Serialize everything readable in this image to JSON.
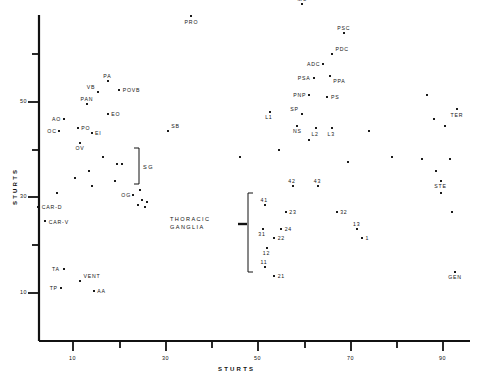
{
  "chart_data": {
    "type": "scatter",
    "title": "",
    "xlabel": "STURTS",
    "ylabel": "STURTS",
    "xlim": [
      0,
      100
    ],
    "ylim": [
      2,
      72
    ],
    "grid": false,
    "legend": "none",
    "xticks": [
      10,
      30,
      50,
      70,
      90
    ],
    "xtick_labels": [
      "10",
      "30",
      "50",
      "70",
      "90"
    ],
    "xminorticks": [
      20,
      40,
      60,
      80
    ],
    "yticks": [
      10,
      30,
      50
    ],
    "ytick_labels": [
      "10",
      "30",
      "50"
    ],
    "yminorticks": [
      20,
      40,
      60
    ],
    "annotations": [
      {
        "text": "SG",
        "x": 27.5,
        "y": 37.5,
        "kind": "bracket-group"
      },
      {
        "text": "THORACIC GANGLIA",
        "x": 38.0,
        "y": 25.0,
        "kind": "bracket-group"
      }
    ],
    "points": [
      {
        "label": "PRO",
        "x": 35.5,
        "y": 68.0,
        "lx": "center",
        "ly": "below"
      },
      {
        "label": "MU",
        "x": 59.5,
        "y": 70.5,
        "lx": "center",
        "ly": "above"
      },
      {
        "label": "PSC",
        "x": 68.5,
        "y": 64.5,
        "lx": "center",
        "ly": "above"
      },
      {
        "label": "PDC",
        "x": 66.0,
        "y": 60.0,
        "lx": "right",
        "ly": "above"
      },
      {
        "label": "ADC",
        "x": 64.0,
        "y": 58.0,
        "lx": "left",
        "ly": "mid"
      },
      {
        "label": "PPA",
        "x": 65.5,
        "y": 55.5,
        "lx": "right",
        "ly": "below"
      },
      {
        "label": "PSA",
        "x": 62.0,
        "y": 55.0,
        "lx": "left",
        "ly": "mid"
      },
      {
        "label": "PNP",
        "x": 61.0,
        "y": 51.5,
        "lx": "left",
        "ly": "mid"
      },
      {
        "label": "PS",
        "x": 65.0,
        "y": 51.0,
        "lx": "right",
        "ly": "mid"
      },
      {
        "label": "PA",
        "x": 17.5,
        "y": 54.5,
        "lx": "center",
        "ly": "above"
      },
      {
        "label": "VB",
        "x": 15.5,
        "y": 52.0,
        "lx": "left",
        "ly": "above"
      },
      {
        "label": "POVB",
        "x": 20.0,
        "y": 52.5,
        "lx": "right",
        "ly": "mid"
      },
      {
        "label": "PAN",
        "x": 13.0,
        "y": 49.5,
        "lx": "center",
        "ly": "above"
      },
      {
        "label": "EO",
        "x": 17.5,
        "y": 47.5,
        "lx": "right",
        "ly": "mid"
      },
      {
        "label": "AO",
        "x": 8.0,
        "y": 46.5,
        "lx": "left",
        "ly": "mid"
      },
      {
        "label": "PO",
        "x": 11.0,
        "y": 44.5,
        "lx": "right",
        "ly": "mid"
      },
      {
        "label": "OC",
        "x": 7.0,
        "y": 44.0,
        "lx": "left",
        "ly": "mid"
      },
      {
        "label": "EI",
        "x": 14.0,
        "y": 43.5,
        "lx": "right",
        "ly": "mid"
      },
      {
        "label": "OV",
        "x": 11.5,
        "y": 41.5,
        "lx": "center",
        "ly": "below"
      },
      {
        "label": "SB",
        "x": 30.5,
        "y": 44.0,
        "lx": "right",
        "ly": "above"
      },
      {
        "label": "L1",
        "x": 52.5,
        "y": 48.0,
        "lx": "center",
        "ly": "below"
      },
      {
        "label": "SP",
        "x": 59.5,
        "y": 47.5,
        "lx": "left",
        "ly": "above"
      },
      {
        "label": "NS",
        "x": 58.5,
        "y": 45.0,
        "lx": "center",
        "ly": "below"
      },
      {
        "label": "L2",
        "x": 62.5,
        "y": 44.5,
        "lx": "center",
        "ly": "below"
      },
      {
        "label": "L3",
        "x": 66.0,
        "y": 44.5,
        "lx": "center",
        "ly": "below"
      },
      {
        "label": "TER",
        "x": 93.0,
        "y": 48.5,
        "lx": "center",
        "ly": "below"
      },
      {
        "label": "STE",
        "x": 89.5,
        "y": 33.5,
        "lx": "center",
        "ly": "below"
      },
      {
        "label": "GEN",
        "x": 92.5,
        "y": 14.5,
        "lx": "center",
        "ly": "below"
      },
      {
        "label": "CAR-D",
        "x": 2.5,
        "y": 28.0,
        "lx": "right",
        "ly": "mid"
      },
      {
        "label": "CAR-V",
        "x": 4.0,
        "y": 25.0,
        "lx": "right",
        "ly": "mid"
      },
      {
        "label": "TA",
        "x": 8.0,
        "y": 15.0,
        "lx": "left",
        "ly": "mid"
      },
      {
        "label": "VENT",
        "x": 11.5,
        "y": 12.5,
        "lx": "right",
        "ly": "above"
      },
      {
        "label": "TP",
        "x": 7.5,
        "y": 11.0,
        "lx": "left",
        "ly": "mid"
      },
      {
        "label": "AA",
        "x": 14.5,
        "y": 10.5,
        "lx": "right",
        "ly": "mid"
      },
      {
        "label": "OG",
        "x": 23.0,
        "y": 30.5,
        "lx": "left",
        "ly": "mid"
      },
      {
        "label": "41",
        "x": 51.5,
        "y": 28.5,
        "lx": "center",
        "ly": "above"
      },
      {
        "label": "42",
        "x": 57.5,
        "y": 32.5,
        "lx": "center",
        "ly": "above"
      },
      {
        "label": "43",
        "x": 63.0,
        "y": 32.5,
        "lx": "center",
        "ly": "above"
      },
      {
        "label": "23",
        "x": 56.0,
        "y": 27.0,
        "lx": "right",
        "ly": "mid"
      },
      {
        "label": "32",
        "x": 67.0,
        "y": 27.0,
        "lx": "right",
        "ly": "mid"
      },
      {
        "label": "31",
        "x": 51.0,
        "y": 23.5,
        "lx": "center",
        "ly": "below"
      },
      {
        "label": "24",
        "x": 55.0,
        "y": 23.5,
        "lx": "right",
        "ly": "mid"
      },
      {
        "label": "13",
        "x": 71.5,
        "y": 23.5,
        "lx": "center",
        "ly": "above"
      },
      {
        "label": "1",
        "x": 72.5,
        "y": 21.5,
        "lx": "right",
        "ly": "mid"
      },
      {
        "label": "22",
        "x": 53.5,
        "y": 21.5,
        "lx": "right",
        "ly": "mid"
      },
      {
        "label": "12",
        "x": 52.0,
        "y": 19.5,
        "lx": "center",
        "ly": "below"
      },
      {
        "label": "11",
        "x": 51.5,
        "y": 15.5,
        "lx": "center",
        "ly": "above"
      },
      {
        "label": "21",
        "x": 53.5,
        "y": 13.5,
        "lx": "right",
        "ly": "mid"
      }
    ],
    "unlabeled_points": [
      {
        "x": 16.5,
        "y": 38.5
      },
      {
        "x": 19.5,
        "y": 37.0
      },
      {
        "x": 20.5,
        "y": 37.0
      },
      {
        "x": 13.5,
        "y": 35.5
      },
      {
        "x": 10.5,
        "y": 34.0
      },
      {
        "x": 19.0,
        "y": 33.5
      },
      {
        "x": 14.0,
        "y": 32.5
      },
      {
        "x": 6.5,
        "y": 31.0
      },
      {
        "x": 24.5,
        "y": 31.5
      },
      {
        "x": 25.0,
        "y": 29.5
      },
      {
        "x": 26.0,
        "y": 29.0
      },
      {
        "x": 24.0,
        "y": 28.5
      },
      {
        "x": 25.5,
        "y": 28.0
      },
      {
        "x": 46.0,
        "y": 38.5
      },
      {
        "x": 54.5,
        "y": 40.0
      },
      {
        "x": 74.0,
        "y": 44.0
      },
      {
        "x": 86.5,
        "y": 51.5
      },
      {
        "x": 88.0,
        "y": 46.5
      },
      {
        "x": 90.5,
        "y": 45.0
      },
      {
        "x": 85.5,
        "y": 38.0
      },
      {
        "x": 91.5,
        "y": 38.0
      },
      {
        "x": 88.5,
        "y": 35.5
      },
      {
        "x": 89.5,
        "y": 31.0
      },
      {
        "x": 92.0,
        "y": 27.0
      },
      {
        "x": 79.0,
        "y": 38.5
      },
      {
        "x": 69.5,
        "y": 37.5
      },
      {
        "x": 61.0,
        "y": 42.0
      }
    ]
  }
}
